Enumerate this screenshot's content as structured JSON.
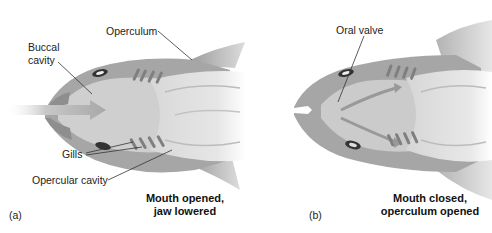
{
  "figure": {
    "panels": [
      {
        "id": "a",
        "tag": "(a)",
        "caption_line1": "Mouth opened,",
        "caption_line2": "jaw lowered",
        "labels": {
          "operculum": "Operculum",
          "buccal_line1": "Buccal",
          "buccal_line2": "cavity",
          "gills": "Gills",
          "opercular_cavity": "Opercular cavity"
        },
        "arrow": "water-inflow-arrow"
      },
      {
        "id": "b",
        "tag": "(b)",
        "caption_line1": "Mouth closed,",
        "caption_line2": "operculum opened",
        "labels": {
          "oral_valve": "Oral valve"
        },
        "arrow": "water-outflow-arrows"
      }
    ],
    "colors": {
      "body_dark": "#9a9a9a",
      "body_mid": "#b8b8b8",
      "body_light": "#d2d2d2",
      "body_lighter": "#e2e2e2",
      "gill": "#7a7a7a",
      "eye": "#333333",
      "leader_line": "#333333"
    }
  }
}
